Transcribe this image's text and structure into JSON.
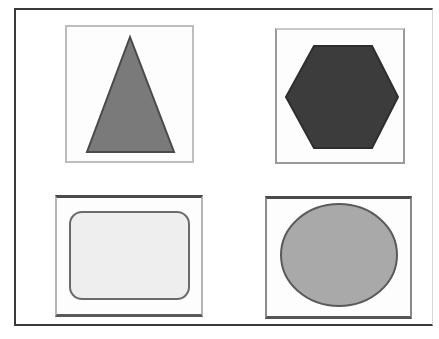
{
  "figure": {
    "panels": [
      {
        "id": "triangle",
        "shape": "triangle",
        "fill": "#7a7a7a",
        "stroke": "#4a4a4a"
      },
      {
        "id": "hexagon",
        "shape": "hexagon",
        "fill": "#3c3c3c",
        "stroke": "#2e2e2e"
      },
      {
        "id": "rounded-rectangle",
        "shape": "rounded-rectangle",
        "fill": "#eeeeee",
        "stroke": "#6a6a6a"
      },
      {
        "id": "ellipse",
        "shape": "ellipse",
        "fill": "#a9a9a9",
        "stroke": "#5a5a5a"
      }
    ]
  }
}
